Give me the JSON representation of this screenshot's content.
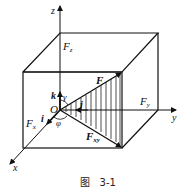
{
  "figure": {
    "caption": "图   3-1",
    "labels": {
      "z": "z",
      "y": "y",
      "x": "x",
      "origin": "O",
      "Fz": "F",
      "Fz_sub": "z",
      "Fy": "F",
      "Fy_sub": "y",
      "Fx": "F",
      "Fx_sub": "x",
      "F": "F",
      "Fxy": "F",
      "Fxy_sub": "xy",
      "i": "i",
      "j": "j",
      "k": "k",
      "gamma": "γ",
      "phi": "φ"
    }
  }
}
